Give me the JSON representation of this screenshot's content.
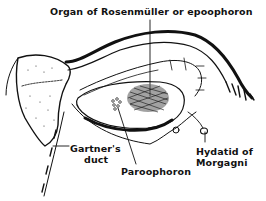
{
  "figure": {
    "type": "anatomical-line-drawing",
    "colors": {
      "ink": "#111111",
      "background": "#ffffff"
    },
    "labels": {
      "epoophoron": "Organ of Rosenmüller or epoophoron",
      "gartner_line1": "Gartner's",
      "gartner_line2": "duct",
      "paroophoron": "Paroophoron",
      "hydatid_line1": "Hydatid of",
      "hydatid_line2": "Morgagni"
    }
  }
}
